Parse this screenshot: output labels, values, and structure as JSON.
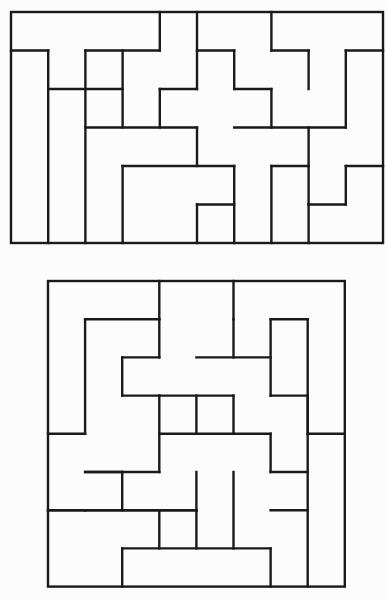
{
  "puzzles": [
    {
      "name": "top-puzzle",
      "cols": 10,
      "rows": 6,
      "origin": [
        11,
        12
      ],
      "cell": [
        37.2,
        38.5
      ],
      "h": [
        [
          1,
          0,
          1
        ],
        [
          1,
          2,
          4
        ],
        [
          1,
          5,
          6
        ],
        [
          1,
          7,
          8
        ],
        [
          1,
          9,
          10
        ],
        [
          2,
          1,
          3
        ],
        [
          2,
          4,
          5
        ],
        [
          2,
          6,
          7
        ],
        [
          3,
          2,
          5
        ],
        [
          3,
          6,
          9
        ],
        [
          4,
          3,
          6
        ],
        [
          4,
          7,
          8
        ],
        [
          4,
          9,
          10
        ],
        [
          5,
          5,
          6
        ],
        [
          5,
          8,
          9
        ]
      ],
      "v": [
        [
          1,
          1,
          6
        ],
        [
          2,
          1,
          6
        ],
        [
          4,
          0,
          1
        ],
        [
          3,
          1,
          3
        ],
        [
          5,
          0,
          2
        ],
        [
          7,
          0,
          1
        ],
        [
          9,
          1,
          3
        ],
        [
          8,
          1,
          2
        ],
        [
          3,
          4,
          6
        ],
        [
          4,
          2,
          3
        ],
        [
          6,
          1,
          2
        ],
        [
          7,
          2,
          3
        ],
        [
          5,
          3,
          4
        ],
        [
          6,
          4,
          6
        ],
        [
          5,
          5,
          6
        ],
        [
          7,
          4,
          6
        ],
        [
          8,
          3,
          4
        ],
        [
          8,
          4,
          5
        ],
        [
          9,
          4,
          5
        ],
        [
          8,
          5,
          6
        ]
      ]
    },
    {
      "name": "bottom-puzzle",
      "cols": 8,
      "rows": 8,
      "origin": [
        48,
        281
      ],
      "cell": [
        37.1,
        38.2
      ],
      "h": [
        [
          1,
          1,
          3
        ],
        [
          1,
          6,
          7
        ],
        [
          2,
          2,
          3
        ],
        [
          2,
          4,
          6
        ],
        [
          3,
          2,
          3
        ],
        [
          3,
          3,
          5
        ],
        [
          3,
          6,
          7
        ],
        [
          4,
          0,
          1
        ],
        [
          4,
          3,
          5
        ],
        [
          4,
          5,
          6
        ],
        [
          4,
          7,
          8
        ],
        [
          5,
          1,
          2
        ],
        [
          5,
          1,
          3
        ],
        [
          5,
          6,
          7
        ],
        [
          6,
          0,
          1
        ],
        [
          6,
          1,
          4
        ],
        [
          6,
          6,
          7
        ],
        [
          7,
          2,
          6
        ],
        [
          6,
          3,
          4
        ],
        [
          6,
          0,
          3
        ]
      ],
      "v": [
        [
          3,
          0,
          1
        ],
        [
          5,
          0,
          1
        ],
        [
          7,
          1,
          8
        ],
        [
          1,
          1,
          4
        ],
        [
          3,
          1,
          2
        ],
        [
          2,
          2,
          3
        ],
        [
          6,
          1,
          3
        ],
        [
          4,
          3,
          4
        ],
        [
          5,
          1,
          2
        ],
        [
          3,
          3,
          5
        ],
        [
          5,
          3,
          4
        ],
        [
          6,
          4,
          5
        ],
        [
          7,
          3,
          4
        ],
        [
          2,
          5,
          6
        ],
        [
          4,
          5,
          6
        ],
        [
          3,
          6,
          7
        ],
        [
          5,
          5,
          7
        ],
        [
          4,
          6,
          7
        ],
        [
          1,
          6,
          6
        ],
        [
          2,
          7,
          8
        ],
        [
          6,
          7,
          8
        ]
      ]
    }
  ]
}
